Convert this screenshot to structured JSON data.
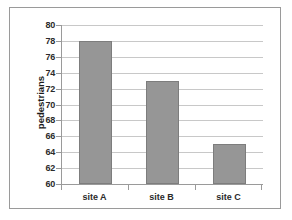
{
  "chart_data": {
    "type": "bar",
    "title": "",
    "subtitle": "",
    "xlabel": "",
    "ylabel": "pedestrians",
    "categories": [
      "site A",
      "site B",
      "site C"
    ],
    "values": [
      78,
      73,
      65
    ],
    "ylim": [
      60,
      80
    ],
    "ytick_step": 2,
    "yticks": [
      80,
      78,
      76,
      74,
      72,
      70,
      68,
      66,
      64,
      62,
      60
    ],
    "grid": true,
    "legend": false,
    "legend_position": "none",
    "annotations": [],
    "colors": {
      "bar_fill": "#969696",
      "bar_border": "#7d7d7d",
      "gridline": "#c8c8c8",
      "axis_line": "#9a9a9a",
      "frame_border": "#9a9a9a",
      "tick_label": "#2b2b2b",
      "axis_title": "#1a1a1a",
      "plot_background": "#ffffff"
    }
  }
}
